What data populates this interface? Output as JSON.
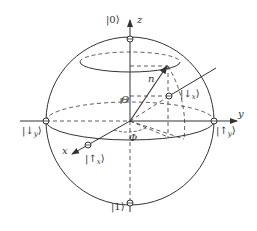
{
  "colors": {
    "stroke": "#333333",
    "background": "#ffffff"
  },
  "axes": {
    "z": "z",
    "y": "y",
    "x": "x"
  },
  "states": {
    "ket0": "|0⟩",
    "ket1": "|1⟩",
    "up_y": "|↑",
    "up_y_sub": "y",
    "down_y": "|↓",
    "down_y_sub": "y",
    "up_x": "|↑",
    "up_x_sub": "x",
    "down_x": "|↓",
    "down_x_sub": "x",
    "ket_close": "⟩"
  },
  "vector": {
    "label": "n"
  },
  "angles": {
    "theta": "Θ",
    "phi": "Φ"
  }
}
